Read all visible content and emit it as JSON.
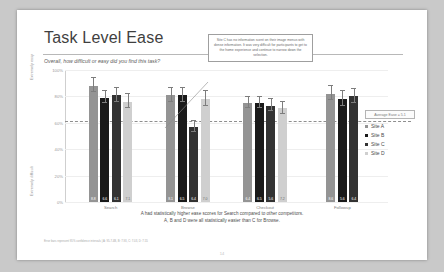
{
  "slide": {
    "title": "Task Level Ease",
    "subtitle": "Overall, how difficult or easy did you find this task?",
    "conclusion_line1": "A had statistically higher ease scores for Search compared to other competitors.",
    "conclusion_line2": "A, B and D were all statistically easier than C for Browse.",
    "footnote": "Error bars represent 95% confidence intervals | A: 95-7.4B, B: 7.93, C: 7.03, D: 7.55",
    "page_number": "14"
  },
  "callout": {
    "text": "Site C has no information scent on their image menus with dense information. It was very difficult for participants to get to the home experience and continue to narrow down the selection."
  },
  "legend": {
    "average_badge": "Average Ease = 5.1",
    "items": [
      {
        "label": "Site A",
        "color": "#949494"
      },
      {
        "label": "Site B",
        "color": "#1a1a1a"
      },
      {
        "label": "Site C",
        "color": "#333333"
      },
      {
        "label": "Site D",
        "color": "#cfcfcf"
      }
    ]
  },
  "chart_data": {
    "type": "bar",
    "title": "Task Level Ease",
    "subtitle": "Overall, how difficult or easy did you find this task?",
    "xlabel": "",
    "ylabel": "Extremely easy",
    "ylabel_bottom": "Extremely difficult",
    "ylim": [
      0,
      100
    ],
    "grid": true,
    "legend_position": "right",
    "yticks": [
      "100%",
      "80%",
      "60%",
      "40%",
      "20%",
      "0%"
    ],
    "ytick_values": [
      100,
      80,
      60,
      40,
      20,
      0
    ],
    "average_line": 61,
    "average_line_label": "Average Ease = 5.1",
    "categories": [
      "Search",
      "Browse",
      "Checkout",
      "Followup"
    ],
    "series": [
      {
        "name": "Site A",
        "color": "#949494",
        "values": [
          88,
          81,
          75,
          82
        ],
        "labels": [
          "8.8",
          "8.1",
          "6.4",
          "8.6"
        ],
        "errors": [
          5,
          5,
          4,
          5
        ]
      },
      {
        "name": "Site B",
        "color": "#1a1a1a",
        "values": [
          79,
          81,
          75,
          78
        ],
        "labels": [
          "6.6",
          "6.5",
          "6.5",
          "5.6"
        ],
        "errors": [
          4,
          5,
          4,
          5
        ]
      },
      {
        "name": "Site C",
        "color": "#333333",
        "values": [
          81,
          57,
          73,
          80
        ],
        "labels": [
          "6.1",
          "6.4",
          "5.6",
          "6.4"
        ],
        "errors": [
          5,
          4,
          4,
          5
        ]
      },
      {
        "name": "Site D",
        "color": "#cfcfcf",
        "values": [
          76,
          78,
          71,
          null
        ],
        "labels": [
          "7.1",
          "7.0",
          "7.2",
          null
        ],
        "errors": [
          5,
          5,
          4,
          null
        ]
      }
    ]
  }
}
